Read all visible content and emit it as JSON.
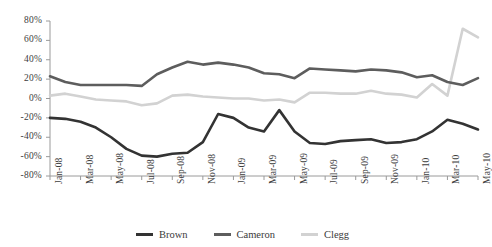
{
  "chart_data": {
    "type": "line",
    "title": "",
    "xlabel": "",
    "ylabel": "",
    "ylim": [
      -80,
      80
    ],
    "ytick_step": 20,
    "grid": false,
    "legend_position": "bottom",
    "yticks": [
      "80%",
      "60%",
      "40%",
      "20%",
      "0%",
      "-20%",
      "-40%",
      "-60%",
      "-80%"
    ],
    "ytick_values": [
      80,
      60,
      40,
      20,
      0,
      -20,
      -40,
      -60,
      -80
    ],
    "x": [
      "Jan-08",
      "Feb-08",
      "Mar-08",
      "Apr-08",
      "May-08",
      "Jun-08",
      "Jul-08",
      "Aug-08",
      "Sep-08",
      "Oct-08",
      "Nov-08",
      "Dec-08",
      "Jan-09",
      "Feb-09",
      "Mar-09",
      "Apr-09",
      "May-09",
      "Jun-09",
      "Jul-09",
      "Aug-09",
      "Sep-09",
      "Oct-09",
      "Nov-09",
      "Dec-09",
      "Jan-10",
      "Feb-10",
      "Mar-10",
      "Apr-10",
      "May-10"
    ],
    "xtick_labels": [
      "Jan-08",
      "Mar-08",
      "May-08",
      "Jul-08",
      "Sep-08",
      "Nov-08",
      "Jan-09",
      "Mar-09",
      "May-09",
      "Jul-09",
      "Sep-09",
      "Nov-09",
      "Jan-10",
      "Mar-10",
      "May-10"
    ],
    "xtick_indices": [
      0,
      2,
      4,
      6,
      8,
      10,
      12,
      14,
      16,
      18,
      20,
      22,
      24,
      26,
      28
    ],
    "series": [
      {
        "name": "Brown",
        "color": "#333333",
        "width": 2.6,
        "values": [
          -20,
          -21,
          -24,
          -30,
          -40,
          -52,
          -59,
          -60,
          -57,
          -56,
          -45,
          -16,
          -20,
          -30,
          -34,
          -12,
          -34,
          -46,
          -47,
          -44,
          -43,
          -42,
          -46,
          -45,
          -42,
          -34,
          -22,
          -26,
          -32
        ]
      },
      {
        "name": "Cameron",
        "color": "#5d5d5d",
        "width": 2.6,
        "values": [
          23,
          17,
          14,
          14,
          14,
          14,
          13,
          25,
          32,
          38,
          35,
          37,
          35,
          32,
          26,
          25,
          21,
          31,
          30,
          29,
          28,
          30,
          29,
          27,
          22,
          24,
          17,
          14,
          21
        ]
      },
      {
        "name": "Clegg",
        "color": "#d2d2d2",
        "width": 2.6,
        "values": [
          3,
          5,
          2,
          -1,
          -2,
          -3,
          -7,
          -5,
          3,
          4,
          2,
          1,
          0,
          0,
          -2,
          -1,
          -4,
          6,
          6,
          5,
          5,
          8,
          5,
          4,
          1,
          15,
          3,
          72,
          63
        ]
      }
    ]
  },
  "legend": {
    "items": [
      {
        "label": "Brown",
        "color": "#333333"
      },
      {
        "label": "Cameron",
        "color": "#5d5d5d"
      },
      {
        "label": "Clegg",
        "color": "#d2d2d2"
      }
    ]
  }
}
